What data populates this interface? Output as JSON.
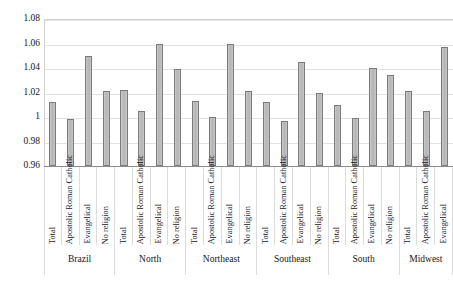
{
  "chart_data": {
    "type": "bar",
    "title": "",
    "subtitle": "",
    "xlabel": "",
    "ylabel": "",
    "ylim": [
      0.96,
      1.08
    ],
    "ytick_labels": [
      "1.08",
      "1.06",
      "1.04",
      "1.02",
      "1",
      "0.98",
      "0.96"
    ],
    "ytick_values": [
      1.08,
      1.06,
      1.04,
      1.02,
      1.0,
      0.98,
      0.96
    ],
    "grid": true,
    "legend": false,
    "legend_position": "none",
    "categories": [
      "Total",
      "Apostolic Roman Catholic",
      "Evangelical",
      "No religion"
    ],
    "groups": [
      {
        "name": "Brazil",
        "bars": [
          {
            "label": "Total",
            "value": 1.012
          },
          {
            "label": "Apostolic Roman Catholic",
            "value": 0.998
          },
          {
            "label": "Evangelical",
            "value": 1.05
          },
          {
            "label": "No religion",
            "value": 1.021
          }
        ]
      },
      {
        "name": "North",
        "bars": [
          {
            "label": "Total",
            "value": 1.022
          },
          {
            "label": "Apostolic Roman Catholic",
            "value": 1.005
          },
          {
            "label": "Evangelical",
            "value": 1.06
          },
          {
            "label": "No religion",
            "value": 1.039
          }
        ]
      },
      {
        "name": "Northeast",
        "bars": [
          {
            "label": "Total",
            "value": 1.013
          },
          {
            "label": "Apostolic Roman Catholic",
            "value": 1.0
          },
          {
            "label": "Evangelical",
            "value": 1.06
          },
          {
            "label": "No religion",
            "value": 1.021
          }
        ]
      },
      {
        "name": "Southeast",
        "bars": [
          {
            "label": "Total",
            "value": 1.012
          },
          {
            "label": "Apostolic Roman Catholic",
            "value": 0.997
          },
          {
            "label": "Evangelical",
            "value": 1.045
          },
          {
            "label": "No religion",
            "value": 1.02
          }
        ]
      },
      {
        "name": "South",
        "bars": [
          {
            "label": "Total",
            "value": 1.01
          },
          {
            "label": "Apostolic Roman Catholic",
            "value": 0.999
          },
          {
            "label": "Evangelical",
            "value": 1.04
          },
          {
            "label": "No religion",
            "value": 1.034
          }
        ]
      },
      {
        "name": "Midwest",
        "bars": [
          {
            "label": "Total",
            "value": 1.021
          },
          {
            "label": "Apostolic Roman Catholic",
            "value": 1.005
          },
          {
            "label": "Evangelical",
            "value": 1.057
          }
        ]
      }
    ],
    "colors": {
      "bar_fill": "#bdbdbd",
      "bar_border": "#7b7b7b",
      "gridline": "#e2e2e2",
      "axis": "#8d8d8d",
      "text": "#161616",
      "background": "#ffffff"
    }
  }
}
